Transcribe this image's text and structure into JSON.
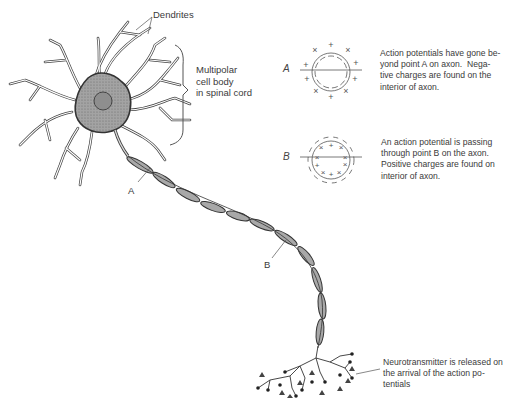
{
  "figure": {
    "labels": {
      "dendrites": "Dendrites",
      "cell_body": "Multipolar\ncell body\nin spinal cord",
      "point_a": "A",
      "point_b": "B",
      "neurotransmitter": "Neurotransmitter is released on\nthe arrival of the action po-\ntentials"
    },
    "insets": [
      {
        "id": "A",
        "label": "A",
        "caption": "Action potentials have gone be-\nyond point A on axon.  Nega-\ntive charges are found on the\ninterior of axon.",
        "outside_charges": "+",
        "inside_charges": "-"
      },
      {
        "id": "B",
        "label": "B",
        "caption": "An action potential is passing\nthrough point B on the axon.\nPositive charges are found on\ninterior of axon.",
        "outside_charges": "-",
        "inside_charges": "+"
      }
    ],
    "colors": {
      "ink": "#3a3a3a",
      "cell_fill": "#9a9a9a",
      "myelin_fill": "#a8a8a8",
      "background": "#ffffff"
    }
  }
}
